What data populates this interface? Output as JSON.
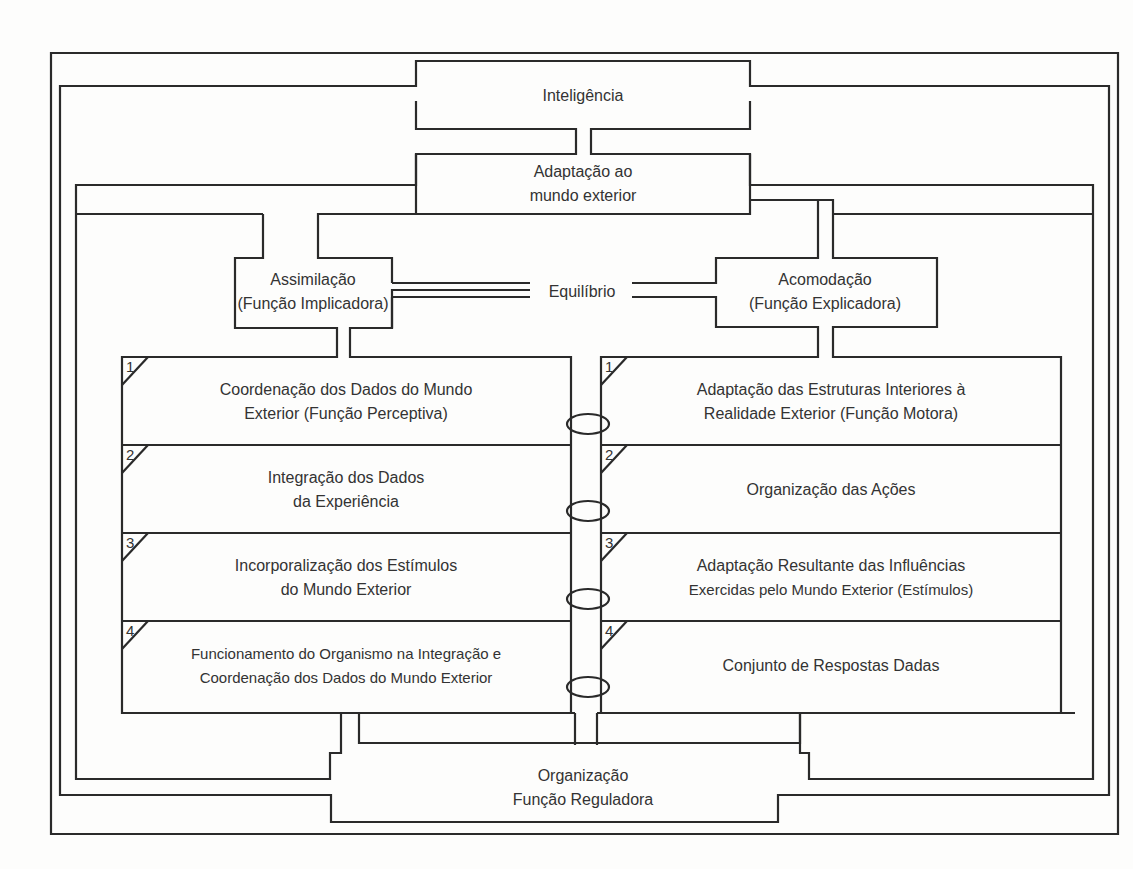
{
  "diagram": {
    "top": {
      "title": "Inteligência"
    },
    "adaptation": {
      "line1": "Adaptação ao",
      "line2": "mundo exterior"
    },
    "assimilation": {
      "line1": "Assimilação",
      "line2": "(Função Implicadora)"
    },
    "accommodation": {
      "line1": "Acomodação",
      "line2": "(Função Explicadora)"
    },
    "equilibrium": {
      "label": "Equilíbrio"
    },
    "left_rows": [
      {
        "num": "1",
        "line1": "Coordenação dos Dados do Mundo",
        "line2": "Exterior (Função Perceptiva)"
      },
      {
        "num": "2",
        "line1": "Integração dos Dados",
        "line2": "da Experiência"
      },
      {
        "num": "3",
        "line1": "Incorporalização dos Estímulos",
        "line2": "do Mundo Exterior"
      },
      {
        "num": "4",
        "line1": "Funcionamento do Organismo na Integração e",
        "line2": "Coordenação dos Dados do Mundo Exterior"
      }
    ],
    "right_rows": [
      {
        "num": "1",
        "line1": "Adaptação das Estruturas Interiores à",
        "line2": "Realidade Exterior (Função Motora)"
      },
      {
        "num": "2",
        "line1": "Organização das Ações",
        "line2": ""
      },
      {
        "num": "3",
        "line1": "Adaptação Resultante das Influências",
        "line2": "Exercidas pelo Mundo Exterior (Estímulos)"
      },
      {
        "num": "4",
        "line1": "Conjunto de Respostas Dadas",
        "line2": ""
      }
    ],
    "bottom": {
      "line1": "Organização",
      "line2": "Função Reguladora"
    },
    "colors": {
      "line": "#2a2a2a",
      "text": "#333333",
      "background": "#fdfdfc"
    }
  }
}
